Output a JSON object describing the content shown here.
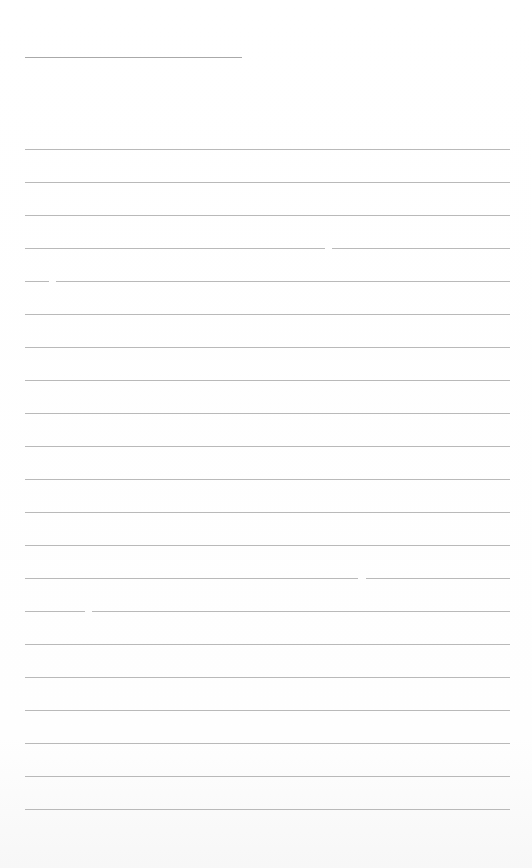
{
  "page": {
    "type": "blank lined writing sheet",
    "line_color": "#b9b9b9",
    "background": "#ffffff",
    "title_line": {
      "y": 57,
      "x1": 25,
      "x2": 242
    },
    "writing_lines": {
      "count": 21,
      "first_y": 149,
      "spacing": 33,
      "x1": 25,
      "x2": 510,
      "gaps": [
        {
          "line": 4,
          "x1": 325,
          "x2": 332
        },
        {
          "line": 5,
          "x1": 49,
          "x2": 56
        },
        {
          "line": 14,
          "x1": 358,
          "x2": 366
        },
        {
          "line": 15,
          "x1": 85,
          "x2": 92
        }
      ]
    }
  }
}
